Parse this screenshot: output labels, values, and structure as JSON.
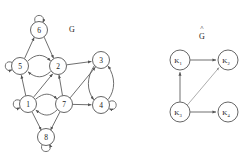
{
  "figure": {
    "type": "directed-graph-pair",
    "background_color": "#ffffff",
    "stroke_color": "#555555",
    "label_color": "#1a1a1a"
  },
  "left_graph": {
    "title": "G",
    "title_position": {
      "x": 72,
      "y": 29
    },
    "nodes": [
      {
        "id": "6",
        "label": "6",
        "x": 39,
        "y": 30,
        "r": 8.5,
        "self_loop": "top"
      },
      {
        "id": "5",
        "label": "5",
        "x": 20,
        "y": 66,
        "r": 8.5,
        "self_loop": "left"
      },
      {
        "id": "2",
        "label": "2",
        "x": 58,
        "y": 66,
        "r": 8.5,
        "self_loop": "none"
      },
      {
        "id": "3",
        "label": "3",
        "x": 101,
        "y": 60,
        "r": 8.5,
        "self_loop": "none"
      },
      {
        "id": "1",
        "label": "1",
        "x": 28,
        "y": 104,
        "r": 8.5,
        "self_loop": "left"
      },
      {
        "id": "7",
        "label": "7",
        "x": 64,
        "y": 104,
        "r": 8.5,
        "self_loop": "none"
      },
      {
        "id": "4",
        "label": "4",
        "x": 101,
        "y": 105,
        "r": 8.5,
        "self_loop": "right"
      },
      {
        "id": "8",
        "label": "8",
        "x": 46,
        "y": 137,
        "r": 8.5,
        "self_loop": "bottom"
      }
    ],
    "edges": [
      {
        "from": "5",
        "to": "6",
        "style": "straight"
      },
      {
        "from": "6",
        "to": "2",
        "style": "straight"
      },
      {
        "from": "5",
        "to": "2",
        "style": "curved"
      },
      {
        "from": "2",
        "to": "5",
        "style": "curved"
      },
      {
        "from": "2",
        "to": "3",
        "style": "straight"
      },
      {
        "from": "1",
        "to": "5",
        "style": "straight"
      },
      {
        "from": "1",
        "to": "2",
        "style": "diagonal"
      },
      {
        "from": "7",
        "to": "2",
        "style": "straight"
      },
      {
        "from": "1",
        "to": "7",
        "style": "curved"
      },
      {
        "from": "7",
        "to": "1",
        "style": "curved"
      },
      {
        "from": "7",
        "to": "3",
        "style": "diagonal"
      },
      {
        "from": "7",
        "to": "4",
        "style": "straight"
      },
      {
        "from": "3",
        "to": "4",
        "style": "curved"
      },
      {
        "from": "4",
        "to": "3",
        "style": "curved"
      },
      {
        "from": "1",
        "to": "8",
        "style": "diagonal"
      },
      {
        "from": "7",
        "to": "8",
        "style": "diagonal"
      }
    ],
    "self_loops": [
      "6",
      "5",
      "1",
      "4",
      "8"
    ]
  },
  "right_graph": {
    "title": "G",
    "title_accent": "^",
    "title_position": {
      "x": 202,
      "y": 35
    },
    "nodes": [
      {
        "id": "K1",
        "label": "K",
        "sub": "1",
        "x": 180,
        "y": 60,
        "r": 10
      },
      {
        "id": "K2",
        "label": "K",
        "sub": "2",
        "x": 228,
        "y": 60,
        "r": 10
      },
      {
        "id": "K3",
        "label": "K",
        "sub": "3",
        "x": 180,
        "y": 112,
        "r": 10
      },
      {
        "id": "K4",
        "label": "K",
        "sub": "4",
        "x": 228,
        "y": 112,
        "r": 10
      }
    ],
    "edges": [
      {
        "from": "K1",
        "to": "K2",
        "style": "straight"
      },
      {
        "from": "K3",
        "to": "K1",
        "style": "straight"
      },
      {
        "from": "K3",
        "to": "K2",
        "style": "diagonal-faint"
      },
      {
        "from": "K3",
        "to": "K4",
        "style": "straight"
      }
    ],
    "self_loops": []
  }
}
